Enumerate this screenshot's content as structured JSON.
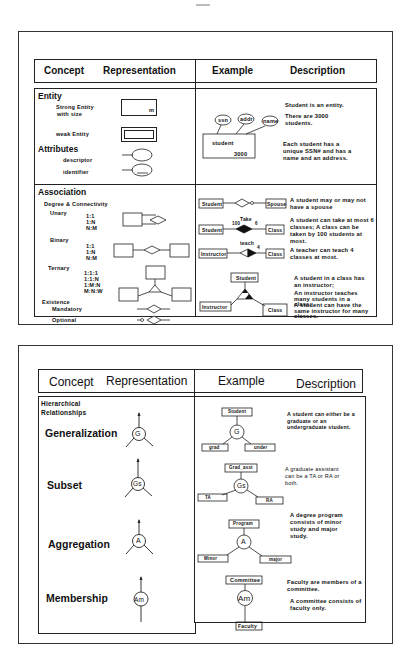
{
  "table1": {
    "header": {
      "concept": "Concept",
      "representation": "Representation",
      "example": "Example",
      "description": "Description"
    },
    "entity": {
      "title": "Entity",
      "strong_entity": "Strong Entity",
      "strong_entity_sub": "with size",
      "size_marker": "m",
      "weak_entity": "weak Entity",
      "attributes_title": "Attributes",
      "descriptor": "descriptor",
      "identifier": "identifier",
      "example": {
        "attrs": [
          "ssn",
          "addr",
          "name"
        ],
        "entity_name": "student",
        "entity_size": "3000"
      },
      "desc": [
        "Student is an entity.",
        "There are 3000 students.",
        "Each student has a unique SSN# and has a name and an address."
      ]
    },
    "association": {
      "title": "Association",
      "degree_label": "Degree & Connectivity",
      "unary": "Unary",
      "unary_conn": [
        "1:1",
        "1:N",
        "N:M"
      ],
      "binary": "Binary",
      "binary_conn": [
        "1:1",
        "1:N",
        "N:M"
      ],
      "ternary": "Ternary",
      "ternary_conn": [
        "1:1:1",
        "1:1:N",
        "1:M:N",
        "M:N:W"
      ],
      "existence": "Existence",
      "mandatory": "Mandatory",
      "optional": "Optional",
      "examples": [
        {
          "left": "Student",
          "right": "Spouse",
          "desc": "A student may or may not have a spouse"
        },
        {
          "left": "Student",
          "right": "Class",
          "rel": "Take",
          "left_card": "100",
          "right_card": "6",
          "desc": "A student can take at most 6 classes; A class can be taken by 100 students at most."
        },
        {
          "left": "Instructor",
          "right": "Class",
          "rel": "teach",
          "right_card": "4",
          "desc": "A teacher can teach 4 classes at most."
        },
        {
          "top": "Student",
          "left": "Instructor",
          "right": "Class",
          "desc": [
            "A student in a class has an instructor;",
            "An instructor teaches many students in a class;",
            "A student can have the same instructor for many classes."
          ]
        }
      ]
    }
  },
  "table2": {
    "header": {
      "concept": "Concept",
      "representation": "Representation",
      "example": "Example",
      "description": "Description"
    },
    "section_title_1": "Hierarchical",
    "section_title_2": "Relationships",
    "rows": [
      {
        "concept": "Generalization",
        "symbol": "G",
        "example_top": "Student",
        "example_left": "grad",
        "example_right": "under",
        "desc": "A student can either be a graduate or an undergraduate student."
      },
      {
        "concept": "Subset",
        "symbol": "Gs",
        "example_top": "Grad_asst",
        "example_left": "TA",
        "example_right": "RA",
        "desc": "A graduate assistant can be a TA or RA or both."
      },
      {
        "concept": "Aggregation",
        "symbol": "A",
        "example_top": "Program",
        "example_left": "Minor",
        "example_right": "major",
        "desc": "A degree program consists of minor study and major study."
      },
      {
        "concept": "Membership",
        "symbol": "Am",
        "example_top": "Committee",
        "example_bottom": "Faculty",
        "desc": [
          "Faculty are members of a committee.",
          "A committee consists of faculty only."
        ]
      }
    ]
  }
}
